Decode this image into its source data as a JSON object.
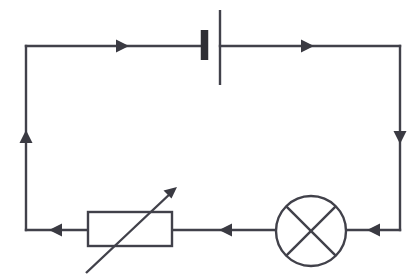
{
  "diagram": {
    "type": "electrical-circuit-schematic",
    "background_color": "#ffffff",
    "line_color": "#41414a",
    "canvas": {
      "width": 420,
      "height": 279
    },
    "loop": {
      "left_x": 26,
      "right_x": 400,
      "top_y": 46,
      "bottom_y": 230
    },
    "components": [
      {
        "id": "cell",
        "name": "cell-battery",
        "label": "",
        "symbol": "battery-cell",
        "position": {
          "x": 212,
          "y": 46
        },
        "negative_plate": {
          "x": 204,
          "y1": 30,
          "y2": 60,
          "thickness": 7.5
        },
        "positive_plate": {
          "x": 220,
          "y1": 10,
          "y2": 85,
          "thickness": 2.4
        }
      },
      {
        "id": "variable-resistor",
        "name": "variable-resistor",
        "label": "",
        "symbol": "resistor-with-diagonal-arrow",
        "box": {
          "x": 88,
          "y": 212,
          "width": 84,
          "height": 34
        },
        "arrow": {
          "x1": 86,
          "y1": 273,
          "x2": 177,
          "y2": 187
        }
      },
      {
        "id": "lamp",
        "name": "lamp",
        "label": "",
        "symbol": "circle-with-cross",
        "center": {
          "x": 311,
          "y": 231
        },
        "radius": 35
      }
    ],
    "current_arrows": [
      {
        "id": "arrow-top-left",
        "name": "current-arrow-top-left",
        "x": 123,
        "y": 46,
        "direction": "right"
      },
      {
        "id": "arrow-top-right",
        "name": "current-arrow-top-right",
        "x": 308,
        "y": 46,
        "direction": "right"
      },
      {
        "id": "arrow-right-side",
        "name": "current-arrow-right-side",
        "x": 400,
        "y": 137,
        "direction": "down"
      },
      {
        "id": "arrow-bottom-right",
        "name": "current-arrow-bottom-right",
        "x": 373,
        "y": 230,
        "direction": "left"
      },
      {
        "id": "arrow-bottom-middle",
        "name": "current-arrow-bottom-middle",
        "x": 225,
        "y": 230,
        "direction": "left"
      },
      {
        "id": "arrow-bottom-left",
        "name": "current-arrow-bottom-left",
        "x": 55,
        "y": 230,
        "direction": "left"
      },
      {
        "id": "arrow-left-side",
        "name": "current-arrow-left-side",
        "x": 26,
        "y": 137,
        "direction": "up"
      }
    ],
    "labels": []
  }
}
